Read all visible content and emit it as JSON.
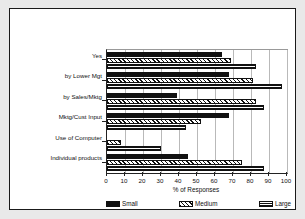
{
  "chart_data": {
    "type": "bar",
    "orientation": "horizontal",
    "title": "",
    "xlabel": "% of Responses",
    "ylabel": "",
    "xlim": [
      0,
      100
    ],
    "xticks": [
      0,
      10,
      20,
      30,
      40,
      50,
      60,
      70,
      80,
      90,
      100
    ],
    "grid": true,
    "grid_axis": "x",
    "legend_position": "bottom",
    "categories": [
      "Yes",
      "by Lower Mgt",
      "by Sales/Mktg",
      "Mktg/Cust Input",
      "Use of Computer",
      "Individual products"
    ],
    "series": [
      {
        "name": "Small",
        "pattern": "solid-black",
        "values": [
          64,
          68,
          39,
          68,
          0,
          45
        ]
      },
      {
        "name": "Medium",
        "pattern": "diagonal-hatch",
        "values": [
          69,
          81,
          83,
          52,
          8,
          75
        ]
      },
      {
        "name": "Large",
        "pattern": "crosshatch-grid",
        "values": [
          83,
          97,
          87,
          44,
          30,
          87
        ]
      }
    ]
  },
  "legend": {
    "items": [
      {
        "label": "Small"
      },
      {
        "label": "Medium"
      },
      {
        "label": "Large"
      }
    ]
  },
  "axis": {
    "x_title": "% of Responses",
    "tick_labels": [
      "0",
      "10",
      "20",
      "30",
      "40",
      "50",
      "60",
      "70",
      "80",
      "90",
      "100"
    ]
  },
  "colors": {
    "ink": "#111111",
    "grid": "#b9b9b9",
    "frame": "#1a1a1a",
    "page": "#e9e9e9",
    "plot_bg": "#ffffff"
  }
}
